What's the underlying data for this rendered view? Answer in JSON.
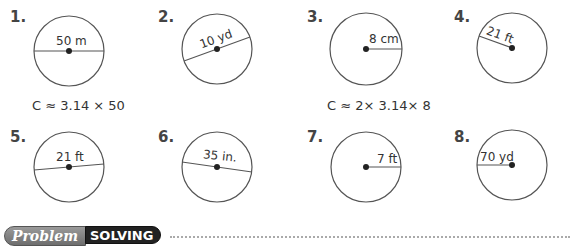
{
  "exercises": [
    {
      "num": "1.",
      "label": "50 m",
      "type": "diameter"
    },
    {
      "num": "2.",
      "label": "10 yd",
      "type": "diameter"
    },
    {
      "num": "3.",
      "label": "8 cm",
      "type": "radius"
    },
    {
      "num": "4.",
      "label": "21 ft",
      "type": "radius"
    },
    {
      "num": "5.",
      "label": "21 ft",
      "type": "diameter"
    },
    {
      "num": "6.",
      "label": "35 in.",
      "type": "diameter"
    },
    {
      "num": "7.",
      "label": "7 ft",
      "type": "radius"
    },
    {
      "num": "8.",
      "label": "70 yd",
      "type": "radius"
    }
  ],
  "formulas": {
    "ex1": "C ≈ 3.14 × 50",
    "ex3": "C ≈ 2× 3.14× 8"
  },
  "banner": {
    "left": "Problem",
    "right": "SOLVING"
  },
  "colors": {
    "circle_stroke": "#555555",
    "banner_dark": "#222222",
    "banner_gray": "#7f7f7f"
  }
}
